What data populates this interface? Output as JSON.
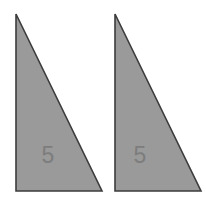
{
  "figure": {
    "type": "geometry-diagram",
    "background_color": "#ffffff",
    "width": 206,
    "height": 206,
    "shape_count": 2,
    "fill_color": "#9a9a9a",
    "stroke_color": "#3c3c3c",
    "stroke_width": 1.6,
    "label_color": "#7a7a7a"
  },
  "shapes": [
    {
      "id": "triangle-left",
      "name": "left-triangle",
      "kind": "right-triangle",
      "points": "16,14 16,191 102,191",
      "vertices": {
        "apex": [
          16,
          14
        ],
        "right_angle": [
          16,
          191
        ],
        "base_end": [
          102,
          191
        ]
      },
      "right_angle_at": "bottom-left",
      "leg_vertical": 177,
      "leg_horizontal": 86,
      "label": {
        "text": "5",
        "x": 48,
        "y": 163,
        "font_size": 23,
        "color": "#7d7d7d"
      }
    },
    {
      "id": "triangle-right",
      "name": "right-triangle",
      "kind": "right-triangle",
      "points": "115,14 115,191 201,191",
      "vertices": {
        "apex": [
          115,
          14
        ],
        "right_angle": [
          115,
          191
        ],
        "base_end": [
          201,
          191
        ]
      },
      "right_angle_at": "bottom-left",
      "leg_vertical": 177,
      "leg_horizontal": 86,
      "label": {
        "text": "5",
        "x": 140,
        "y": 163,
        "font_size": 23,
        "color": "#7d7d7d"
      }
    }
  ]
}
